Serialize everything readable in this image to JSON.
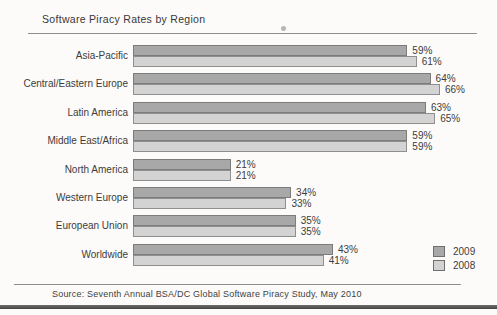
{
  "title": "Software Piracy Rates by Region",
  "source_note": "Source: Seventh Annual BSA/DC Global Software Piracy Study, May 2010",
  "colors": {
    "series_2009_fill": "#a8a8a8",
    "series_2009_border": "#7c7c7c",
    "series_2008_fill": "#d3d3d3",
    "series_2008_border": "#8f8f8f",
    "text": "#3c3c3c",
    "rule": "#8f8f8f"
  },
  "chart_data": {
    "type": "bar",
    "orientation": "horizontal",
    "title": "Software Piracy Rates by Region",
    "categories": [
      "Asia-Pacific",
      "Central/Eastern Europe",
      "Latin America",
      "Middle East/Africa",
      "North America",
      "Western Europe",
      "European Union",
      "Worldwide"
    ],
    "series": [
      {
        "name": "2009",
        "color": "#a8a8a8",
        "border_color": "#7c7c7c",
        "values": [
          59,
          64,
          63,
          59,
          21,
          34,
          35,
          43
        ]
      },
      {
        "name": "2008",
        "color": "#d3d3d3",
        "border_color": "#8f8f8f",
        "values": [
          61,
          66,
          65,
          59,
          21,
          33,
          35,
          41
        ]
      }
    ],
    "value_suffix": "%",
    "xlim": [
      0,
      100
    ],
    "grid": false,
    "legend_position": "bottom-right",
    "data_labels": true
  }
}
